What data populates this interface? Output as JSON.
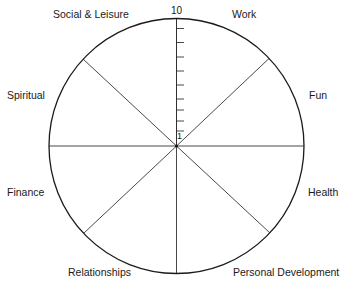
{
  "diagram": {
    "type": "wheel",
    "center": {
      "x": 176.5,
      "y": 146
    },
    "radius": 127.5,
    "stroke_color": "#1a1a1a",
    "background": "#ffffff",
    "segments": 8,
    "scale": {
      "min_label": "1",
      "max_label": "10",
      "tick_count": 9
    },
    "categories": [
      {
        "label": "Work"
      },
      {
        "label": "Fun"
      },
      {
        "label": "Health"
      },
      {
        "label": "Personal Development"
      },
      {
        "label": "Relationships"
      },
      {
        "label": "Finance"
      },
      {
        "label": "Spiritual"
      },
      {
        "label": "Social & Leisure"
      }
    ]
  }
}
